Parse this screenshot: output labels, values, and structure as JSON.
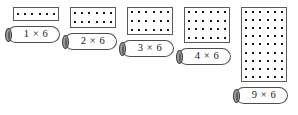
{
  "page": {
    "background_color": "#ffffff",
    "dot_color": "#1a1a1a",
    "outline_color": "#5a5a5a",
    "label_cap_color": "#9a9a9a"
  },
  "arrays": [
    {
      "id": "array-1x6",
      "label": "1 × 6",
      "rows": 1,
      "cols": 6,
      "total": 6,
      "grid": {
        "x": 13,
        "y": 7,
        "w": 46,
        "h": 14
      },
      "label_box": {
        "x": 7,
        "y": 26,
        "w": 53
      }
    },
    {
      "id": "array-2x6",
      "label": "2 × 6",
      "rows": 2,
      "cols": 6,
      "total": 12,
      "grid": {
        "x": 70,
        "y": 7,
        "w": 46,
        "h": 21
      },
      "label_box": {
        "x": 64,
        "y": 33,
        "w": 53
      }
    },
    {
      "id": "array-3x6",
      "label": "3 × 6",
      "rows": 3,
      "cols": 6,
      "total": 18,
      "grid": {
        "x": 127,
        "y": 7,
        "w": 46,
        "h": 28
      },
      "label_box": {
        "x": 121,
        "y": 40,
        "w": 53
      }
    },
    {
      "id": "array-4x6",
      "label": "4 × 6",
      "rows": 4,
      "cols": 6,
      "total": 24,
      "grid": {
        "x": 184,
        "y": 7,
        "w": 46,
        "h": 36
      },
      "label_box": {
        "x": 178,
        "y": 48,
        "w": 53
      }
    },
    {
      "id": "array-9x6",
      "label": "9 × 6",
      "rows": 9,
      "cols": 6,
      "total": 54,
      "grid": {
        "x": 241,
        "y": 7,
        "w": 46,
        "h": 75
      },
      "label_box": {
        "x": 235,
        "y": 87,
        "w": 53
      }
    }
  ]
}
